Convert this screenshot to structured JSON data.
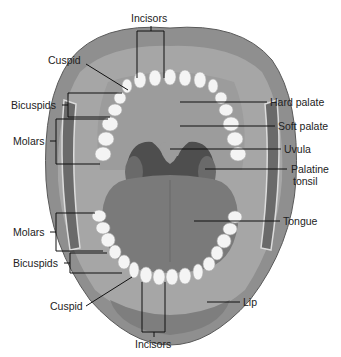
{
  "diagram": {
    "colors": {
      "lip": "#8f8f8f",
      "lip_dark": "#6e6e6e",
      "gum": "#b4b4b4",
      "palate": "#9a9a9a",
      "throat": "#4e4e4e",
      "tongue": "#7a7a7a",
      "teeth": "#f4f4f4",
      "cheek": "#6a6a6a",
      "leader": "#111111"
    },
    "labels": {
      "incisors_top": "Incisors",
      "cuspid_top": "Cuspid",
      "bicuspids_top": "Bicuspids",
      "molars_top": "Molars",
      "hard_palate": "Hard palate",
      "soft_palate": "Soft palate",
      "uvula": "Uvula",
      "palatine_tonsil_line1": "Palatine",
      "palatine_tonsil_line2": "tonsil",
      "tongue": "Tongue",
      "molars_bottom": "Molars",
      "bicuspids_bottom": "Bicuspids",
      "cuspid_bottom": "Cuspid",
      "lip": "Lip",
      "incisors_bottom": "Incisors"
    }
  }
}
